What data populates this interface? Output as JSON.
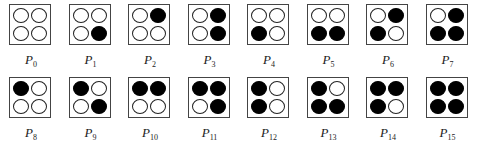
{
  "figure": {
    "patterns": [
      {
        "label": "P",
        "index": "0",
        "cells": [
          0,
          0,
          0,
          0
        ]
      },
      {
        "label": "P",
        "index": "1",
        "cells": [
          0,
          0,
          0,
          1
        ]
      },
      {
        "label": "P",
        "index": "2",
        "cells": [
          0,
          1,
          0,
          0
        ]
      },
      {
        "label": "P",
        "index": "3",
        "cells": [
          0,
          1,
          0,
          1
        ]
      },
      {
        "label": "P",
        "index": "4",
        "cells": [
          0,
          0,
          1,
          0
        ]
      },
      {
        "label": "P",
        "index": "5",
        "cells": [
          0,
          0,
          1,
          1
        ]
      },
      {
        "label": "P",
        "index": "6",
        "cells": [
          0,
          1,
          1,
          0
        ]
      },
      {
        "label": "P",
        "index": "7",
        "cells": [
          0,
          1,
          1,
          1
        ]
      },
      {
        "label": "P",
        "index": "8",
        "cells": [
          1,
          0,
          0,
          0
        ]
      },
      {
        "label": "P",
        "index": "9",
        "cells": [
          1,
          0,
          0,
          1
        ]
      },
      {
        "label": "P",
        "index": "10",
        "cells": [
          1,
          1,
          0,
          0
        ]
      },
      {
        "label": "P",
        "index": "11",
        "cells": [
          1,
          1,
          0,
          1
        ]
      },
      {
        "label": "P",
        "index": "12",
        "cells": [
          1,
          0,
          1,
          0
        ]
      },
      {
        "label": "P",
        "index": "13",
        "cells": [
          1,
          0,
          1,
          1
        ]
      },
      {
        "label": "P",
        "index": "14",
        "cells": [
          1,
          1,
          1,
          0
        ]
      },
      {
        "label": "P",
        "index": "15",
        "cells": [
          1,
          1,
          1,
          1
        ]
      }
    ],
    "cell_order": [
      "top-left",
      "top-right",
      "bottom-left",
      "bottom-right"
    ],
    "colors": {
      "filled": "#000000",
      "empty": "#ffffff",
      "border": "#444444"
    }
  }
}
